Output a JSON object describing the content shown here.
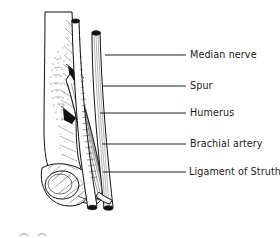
{
  "figure": {
    "ink_color": "#111111",
    "background_color": "#ffffff",
    "label_color": "#1a1a1a"
  },
  "labels": [
    {
      "id": "median-nerve",
      "text": "Median nerve",
      "leader_x1": 105,
      "leader_x2": 186,
      "leader_y": 55,
      "text_x": 190,
      "text_y": 55
    },
    {
      "id": "spur",
      "text": "Spur",
      "leader_x1": 103,
      "leader_x2": 186,
      "leader_y": 86,
      "text_x": 190,
      "text_y": 86
    },
    {
      "id": "humerus",
      "text": "Humerus",
      "leader_x1": 100,
      "leader_x2": 186,
      "leader_y": 113,
      "text_x": 190,
      "text_y": 113
    },
    {
      "id": "brachial-artery",
      "text": "Brachial artery",
      "leader_x1": 102,
      "leader_x2": 186,
      "leader_y": 144,
      "text_x": 190,
      "text_y": 144
    },
    {
      "id": "ligament-of-struthers",
      "text": "Ligament of Struthers",
      "leader_x1": 103,
      "leader_x2": 186,
      "leader_y": 172,
      "text_x": 189,
      "text_y": 172
    }
  ]
}
